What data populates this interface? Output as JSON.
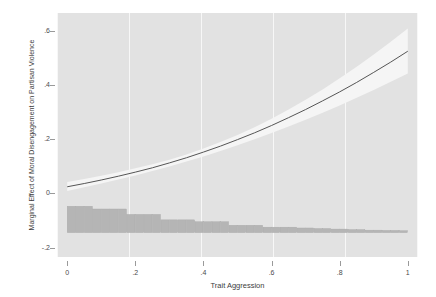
{
  "chart_data": {
    "type": "line",
    "title": "",
    "xlabel": "Trait Aggression",
    "ylabel": "Marginal Effect of Moral Disengagement on Partisan Violence",
    "xlim": [
      -0.03,
      1.03
    ],
    "ylim": [
      -0.235,
      0.665
    ],
    "xticks": [
      0,
      0.2,
      0.4,
      0.6,
      0.8,
      1
    ],
    "xticklabels": [
      "0",
      ".2",
      ".4",
      ".6",
      ".8",
      "1"
    ],
    "yticks": [
      -0.2,
      0,
      0.2,
      0.4,
      0.6
    ],
    "yticklabels": [
      "-.2",
      "0",
      ".2",
      ".4",
      ".6"
    ],
    "grid": "vertical-only",
    "legend": "none",
    "background_color": "#e2e2e2",
    "gridline_color": "#f7f7f7",
    "line_color": "#555555",
    "band_color": "#f5f5f5",
    "hist_color": "#b5b5b5",
    "series": [
      {
        "name": "Marginal effect",
        "x": [
          0,
          0.05,
          0.1,
          0.15,
          0.2,
          0.25,
          0.3,
          0.35,
          0.4,
          0.45,
          0.5,
          0.55,
          0.6,
          0.65,
          0.7,
          0.75,
          0.8,
          0.85,
          0.9,
          0.95,
          1
        ],
        "y": [
          0.024,
          0.036,
          0.049,
          0.063,
          0.078,
          0.094,
          0.112,
          0.131,
          0.152,
          0.174,
          0.198,
          0.223,
          0.25,
          0.279,
          0.309,
          0.341,
          0.374,
          0.409,
          0.446,
          0.484,
          0.524
        ]
      },
      {
        "name": "95% CI lower",
        "x": [
          0,
          0.05,
          0.1,
          0.15,
          0.2,
          0.25,
          0.3,
          0.35,
          0.4,
          0.45,
          0.5,
          0.55,
          0.6,
          0.65,
          0.7,
          0.75,
          0.8,
          0.85,
          0.9,
          0.95,
          1
        ],
        "y": [
          0.008,
          0.022,
          0.036,
          0.051,
          0.066,
          0.082,
          0.099,
          0.117,
          0.136,
          0.156,
          0.177,
          0.199,
          0.222,
          0.246,
          0.271,
          0.297,
          0.324,
          0.352,
          0.381,
          0.411,
          0.442
        ]
      },
      {
        "name": "95% CI upper",
        "x": [
          0,
          0.05,
          0.1,
          0.15,
          0.2,
          0.25,
          0.3,
          0.35,
          0.4,
          0.45,
          0.5,
          0.55,
          0.6,
          0.65,
          0.7,
          0.75,
          0.8,
          0.85,
          0.9,
          0.95,
          1
        ],
        "y": [
          0.042,
          0.053,
          0.065,
          0.078,
          0.092,
          0.107,
          0.124,
          0.143,
          0.165,
          0.189,
          0.215,
          0.244,
          0.275,
          0.309,
          0.345,
          0.383,
          0.424,
          0.467,
          0.512,
          0.559,
          0.608
        ]
      }
    ],
    "histogram": {
      "name": "Distribution of Trait Aggression",
      "baseline": -0.145,
      "bin_left": [
        0.0,
        0.025,
        0.05,
        0.075,
        0.1,
        0.125,
        0.15,
        0.175,
        0.2,
        0.225,
        0.25,
        0.275,
        0.3,
        0.325,
        0.35,
        0.375,
        0.4,
        0.425,
        0.45,
        0.475,
        0.5,
        0.525,
        0.55,
        0.575,
        0.6,
        0.625,
        0.65,
        0.675,
        0.7,
        0.725,
        0.75,
        0.775,
        0.8,
        0.825,
        0.85,
        0.875,
        0.9,
        0.925,
        0.95,
        0.975
      ],
      "bin_width": 0.025,
      "top": [
        -0.048,
        -0.048,
        -0.048,
        -0.058,
        -0.058,
        -0.058,
        -0.058,
        -0.078,
        -0.078,
        -0.078,
        -0.078,
        -0.098,
        -0.098,
        -0.098,
        -0.098,
        -0.105,
        -0.105,
        -0.105,
        -0.105,
        -0.118,
        -0.118,
        -0.118,
        -0.118,
        -0.125,
        -0.125,
        -0.125,
        -0.125,
        -0.128,
        -0.128,
        -0.13,
        -0.13,
        -0.132,
        -0.132,
        -0.134,
        -0.134,
        -0.136,
        -0.136,
        -0.137,
        -0.137,
        -0.138
      ]
    }
  }
}
